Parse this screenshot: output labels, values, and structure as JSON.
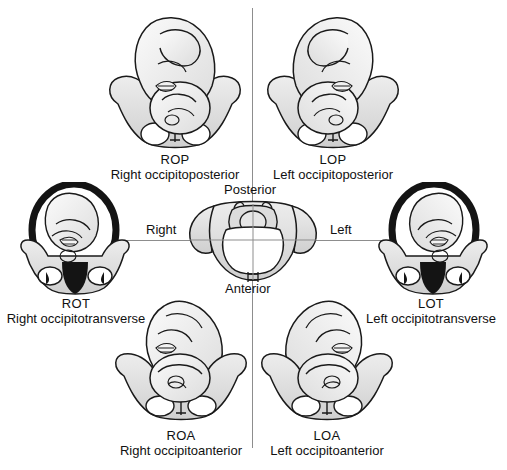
{
  "figure": {
    "background_color": "#ffffff",
    "axis_color": "#8d8d8d",
    "outline_color": "#1a1a1a",
    "shade_color": "#d8d8d8",
    "dark_fill_color": "#111111"
  },
  "center": {
    "name": "maternal-pelvis-orientation",
    "posterior": "Posterior",
    "anterior": "Anterior",
    "right": "Right",
    "left": "Left"
  },
  "positions": [
    {
      "id": "rop",
      "abbr": "ROP",
      "full": "Right occipitoposterior",
      "quadrant": "top-left",
      "highlighted": false
    },
    {
      "id": "lop",
      "abbr": "LOP",
      "full": "Left occipitoposterior",
      "quadrant": "top-right",
      "highlighted": false
    },
    {
      "id": "rot",
      "abbr": "ROT",
      "full": "Right occipitotransverse",
      "quadrant": "middle-left",
      "highlighted": true
    },
    {
      "id": "lot",
      "abbr": "LOT",
      "full": "Left occipitotransverse",
      "quadrant": "middle-right",
      "highlighted": true
    },
    {
      "id": "roa",
      "abbr": "ROA",
      "full": "Right occipitoanterior",
      "quadrant": "bottom-left",
      "highlighted": false
    },
    {
      "id": "loa",
      "abbr": "LOA",
      "full": "Left occipitoanterior",
      "quadrant": "bottom-right",
      "highlighted": false
    }
  ]
}
